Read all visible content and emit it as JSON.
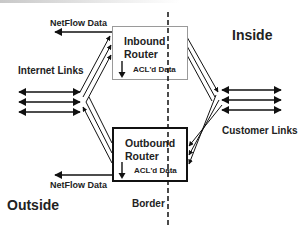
{
  "diagram": {
    "regions": {
      "outside": "Outside",
      "inside": "Inside",
      "border": "Border"
    },
    "inbound_router": {
      "title_line1": "Inbound",
      "title_line2": "Router",
      "acl_label": "ACL'd Data"
    },
    "outbound_router": {
      "title_line1": "Outbound",
      "title_line2": "Router",
      "acl_label": "ACL'd Data"
    },
    "netflow_top": "NetFlow Data",
    "netflow_bottom": "NetFlow Data",
    "internet_links": "Internet Links",
    "customer_links": "Customer Links",
    "colors": {
      "line": "#111111",
      "inbound_box_border": "#9a9a9a",
      "outbound_box_border": "#111111",
      "text": "#222222"
    }
  }
}
